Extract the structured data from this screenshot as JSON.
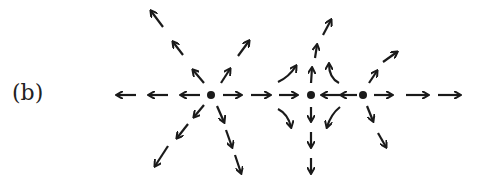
{
  "figure": {
    "label": "(b)",
    "color": "#1a1a1a",
    "fixed_points": [
      {
        "x": 211,
        "y": 95
      },
      {
        "x": 311,
        "y": 95
      },
      {
        "x": 363,
        "y": 95
      }
    ],
    "arrows": [
      {
        "x1": 136,
        "y1": 95,
        "x2": 117,
        "y2": 95
      },
      {
        "x1": 168,
        "y1": 95,
        "x2": 149,
        "y2": 95
      },
      {
        "x1": 200,
        "y1": 95,
        "x2": 181,
        "y2": 95
      },
      {
        "x1": 223,
        "y1": 95,
        "x2": 241,
        "y2": 95
      },
      {
        "x1": 251,
        "y1": 95,
        "x2": 270,
        "y2": 95
      },
      {
        "x1": 279,
        "y1": 95,
        "x2": 297,
        "y2": 95
      },
      {
        "x1": 340,
        "y1": 95,
        "x2": 322,
        "y2": 95
      },
      {
        "x1": 357,
        "y1": 95,
        "x2": 341,
        "y2": 95
      },
      {
        "x1": 374,
        "y1": 95,
        "x2": 392,
        "y2": 95
      },
      {
        "x1": 406,
        "y1": 95,
        "x2": 428,
        "y2": 95
      },
      {
        "x1": 438,
        "y1": 95,
        "x2": 460,
        "y2": 95
      },
      {
        "x1": 204,
        "y1": 83,
        "x2": 193,
        "y2": 70
      },
      {
        "x1": 183,
        "y1": 55,
        "x2": 173,
        "y2": 42
      },
      {
        "x1": 163,
        "y1": 27,
        "x2": 151,
        "y2": 11
      },
      {
        "x1": 221,
        "y1": 83,
        "x2": 230,
        "y2": 69
      },
      {
        "x1": 238,
        "y1": 56,
        "x2": 249,
        "y2": 41
      },
      {
        "x1": 204,
        "y1": 105,
        "x2": 194,
        "y2": 117
      },
      {
        "x1": 188,
        "y1": 124,
        "x2": 177,
        "y2": 138
      },
      {
        "x1": 168,
        "y1": 146,
        "x2": 155,
        "y2": 166
      },
      {
        "x1": 217,
        "y1": 106,
        "x2": 224,
        "y2": 122
      },
      {
        "x1": 226,
        "y1": 130,
        "x2": 232,
        "y2": 147
      },
      {
        "x1": 235,
        "y1": 155,
        "x2": 241,
        "y2": 173
      },
      {
        "x1": 311,
        "y1": 83,
        "x2": 312,
        "y2": 68
      },
      {
        "x1": 315,
        "y1": 58,
        "x2": 317,
        "y2": 45
      },
      {
        "x1": 323,
        "y1": 35,
        "x2": 331,
        "y2": 20
      },
      {
        "x1": 311,
        "y1": 107,
        "x2": 311,
        "y2": 121
      },
      {
        "x1": 311,
        "y1": 132,
        "x2": 311,
        "y2": 147
      },
      {
        "x1": 311,
        "y1": 158,
        "x2": 311,
        "y2": 173
      },
      {
        "x1": 369,
        "y1": 83,
        "x2": 377,
        "y2": 71
      },
      {
        "x1": 383,
        "y1": 62,
        "x2": 397,
        "y2": 52
      },
      {
        "x1": 367,
        "y1": 106,
        "x2": 373,
        "y2": 121
      },
      {
        "x1": 378,
        "y1": 133,
        "x2": 386,
        "y2": 147
      }
    ],
    "curved_arrows": [
      {
        "d": "M278 82 Q 289 77 296 66",
        "tip": [
          296,
          66
        ],
        "angle": -60
      },
      {
        "d": "M339 83 Q 329 78 329 64",
        "tip": [
          329,
          64
        ],
        "angle": -95
      },
      {
        "d": "M278 109 Q 288 114 291 127",
        "tip": [
          291,
          127
        ],
        "angle": 75
      },
      {
        "d": "M340 107 Q 331 114 327 127",
        "tip": [
          327,
          127
        ],
        "angle": 105
      }
    ]
  }
}
